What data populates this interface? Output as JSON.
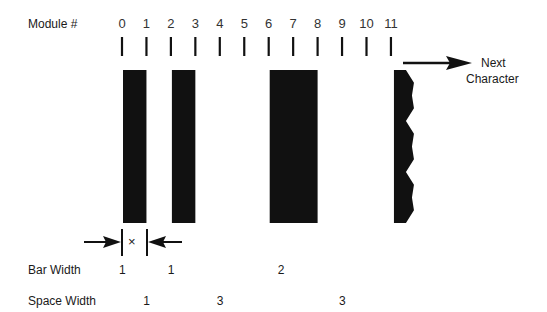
{
  "labels": {
    "module": "Module #",
    "bar_width": "Bar Width",
    "space_width": "Space Width",
    "next_character_line1": "Next",
    "next_character_line2": "Character",
    "x_marker": "×"
  },
  "modules": [
    "0",
    "1",
    "2",
    "3",
    "4",
    "5",
    "6",
    "7",
    "8",
    "9",
    "10",
    "11"
  ],
  "bars": [
    {
      "start_module": 0,
      "width_modules": 1
    },
    {
      "start_module": 2,
      "width_modules": 1
    },
    {
      "start_module": 6,
      "width_modules": 2
    },
    {
      "start_module": 11,
      "width_modules": 1,
      "jagged": true
    }
  ],
  "bar_widths": [
    {
      "value": "1",
      "at_module": 0.5
    },
    {
      "value": "1",
      "at_module": 2.5
    },
    {
      "value": "2",
      "at_module": 7
    }
  ],
  "space_widths": [
    {
      "value": "1",
      "at_module": 1.5
    },
    {
      "value": "3",
      "at_module": 4.5
    },
    {
      "value": "3",
      "at_module": 9.5
    }
  ],
  "colors": {
    "ink": "#111111",
    "background": "#ffffff"
  }
}
